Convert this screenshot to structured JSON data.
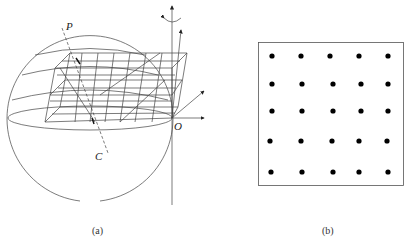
{
  "figure_a": {
    "caption": "(a)",
    "labels": {
      "point_p": "P",
      "point_c": "C",
      "origin": "O"
    },
    "description": "Sphere with a layered 3D grid slab, a dashed line from P through the sphere to C, and coordinate axes with a rotation arrow at origin O"
  },
  "figure_b": {
    "caption": "(b)",
    "grid_rows": 5,
    "grid_cols": 5,
    "description": "Square box containing a 5 by 5 array of dots"
  },
  "colors": {
    "line": "#444444",
    "dot": "#000000"
  }
}
